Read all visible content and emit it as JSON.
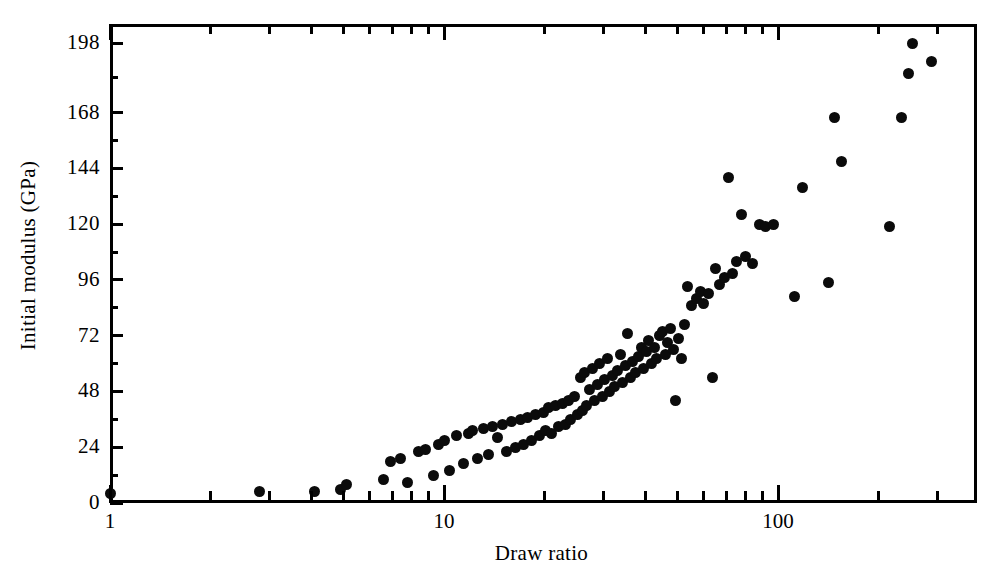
{
  "figure": {
    "width": 1007,
    "height": 580,
    "background": "#ffffff",
    "ink_color": "#0b0b0b"
  },
  "chart_data": {
    "type": "scatter",
    "title": "",
    "xlabel": "Draw ratio",
    "ylabel": "Initial modulus (GPa)",
    "xscale": "log",
    "yscale": "linear",
    "xlim": [
      1,
      300
    ],
    "ylim": [
      0,
      208
    ],
    "grid": false,
    "legend": null,
    "marker": {
      "shape": "circle",
      "filled": true,
      "color": "#0b0b0b",
      "size_px": 11
    },
    "xticks_major": [
      1,
      10,
      100
    ],
    "xtick_labels": [
      "1",
      "10",
      "100"
    ],
    "xticks_minor": [
      2,
      3,
      4,
      5,
      6,
      7,
      8,
      9,
      20,
      30,
      40,
      50,
      60,
      70,
      80,
      90,
      200,
      300
    ],
    "yticks": [
      0,
      24,
      48,
      72,
      96,
      120,
      144,
      168,
      198
    ],
    "ytick_labels": [
      "0",
      "24",
      "48",
      "72",
      "96",
      "120",
      "144",
      "168",
      "198"
    ],
    "yticks_minor": [
      12,
      36,
      60,
      84,
      108,
      132,
      156,
      183
    ],
    "points": [
      [
        1.0,
        4
      ],
      [
        2.8,
        5
      ],
      [
        4.1,
        5
      ],
      [
        4.9,
        6
      ],
      [
        5.1,
        8
      ],
      [
        6.6,
        10
      ],
      [
        6.9,
        18
      ],
      [
        7.4,
        19
      ],
      [
        7.8,
        9
      ],
      [
        8.4,
        22
      ],
      [
        8.8,
        23
      ],
      [
        9.3,
        12
      ],
      [
        9.6,
        25
      ],
      [
        10.0,
        27
      ],
      [
        10.4,
        14
      ],
      [
        10.9,
        29
      ],
      [
        11.4,
        17
      ],
      [
        11.8,
        30
      ],
      [
        12.2,
        31
      ],
      [
        12.6,
        19
      ],
      [
        13.1,
        32
      ],
      [
        13.6,
        21
      ],
      [
        14.0,
        33
      ],
      [
        14.5,
        28
      ],
      [
        15.0,
        34
      ],
      [
        15.4,
        22
      ],
      [
        15.9,
        35
      ],
      [
        16.4,
        24
      ],
      [
        16.9,
        36
      ],
      [
        17.3,
        25
      ],
      [
        17.8,
        37
      ],
      [
        18.3,
        27
      ],
      [
        18.8,
        38
      ],
      [
        19.3,
        29
      ],
      [
        19.8,
        39
      ],
      [
        20.2,
        31
      ],
      [
        20.6,
        41
      ],
      [
        21.0,
        30
      ],
      [
        21.5,
        42
      ],
      [
        22.0,
        33
      ],
      [
        22.6,
        43
      ],
      [
        23.1,
        34
      ],
      [
        23.6,
        44
      ],
      [
        24.0,
        36
      ],
      [
        24.6,
        46
      ],
      [
        25.1,
        38
      ],
      [
        25.6,
        54
      ],
      [
        26.0,
        40
      ],
      [
        26.4,
        56
      ],
      [
        26.8,
        42
      ],
      [
        27.3,
        49
      ],
      [
        27.8,
        58
      ],
      [
        28.3,
        44
      ],
      [
        28.8,
        51
      ],
      [
        29.3,
        60
      ],
      [
        29.8,
        46
      ],
      [
        30.3,
        53
      ],
      [
        30.8,
        62
      ],
      [
        31.4,
        48
      ],
      [
        31.9,
        55
      ],
      [
        32.5,
        50
      ],
      [
        33.1,
        57
      ],
      [
        33.7,
        64
      ],
      [
        34.3,
        52
      ],
      [
        34.9,
        59
      ],
      [
        35.5,
        73
      ],
      [
        36.2,
        54
      ],
      [
        36.8,
        61
      ],
      [
        37.5,
        56
      ],
      [
        38.2,
        63
      ],
      [
        38.9,
        67
      ],
      [
        39.6,
        58
      ],
      [
        40.3,
        65
      ],
      [
        41.0,
        70
      ],
      [
        41.8,
        60
      ],
      [
        42.6,
        67
      ],
      [
        43.4,
        62
      ],
      [
        44.2,
        72
      ],
      [
        45.0,
        74
      ],
      [
        45.9,
        64
      ],
      [
        46.8,
        69
      ],
      [
        47.7,
        75
      ],
      [
        48.6,
        66
      ],
      [
        49.5,
        44
      ],
      [
        50.5,
        71
      ],
      [
        51.5,
        62
      ],
      [
        52.5,
        77
      ],
      [
        53.5,
        93
      ],
      [
        55.0,
        85
      ],
      [
        57.0,
        88
      ],
      [
        58.5,
        91
      ],
      [
        60.0,
        86
      ],
      [
        62.0,
        90
      ],
      [
        63.5,
        54
      ],
      [
        65.0,
        101
      ],
      [
        67.0,
        94
      ],
      [
        69.0,
        97
      ],
      [
        71.0,
        140
      ],
      [
        73.0,
        99
      ],
      [
        75.0,
        104
      ],
      [
        78.0,
        124
      ],
      [
        80.0,
        106
      ],
      [
        84.0,
        103
      ],
      [
        88.0,
        120
      ],
      [
        92.0,
        119
      ],
      [
        97.0,
        120
      ],
      [
        112.0,
        89
      ],
      [
        118.0,
        136
      ],
      [
        142.0,
        95
      ],
      [
        148.0,
        166
      ],
      [
        155.0,
        147
      ],
      [
        215.0,
        119
      ],
      [
        235.0,
        166
      ],
      [
        246.0,
        185
      ],
      [
        252.0,
        198
      ],
      [
        288.0,
        190
      ]
    ]
  }
}
